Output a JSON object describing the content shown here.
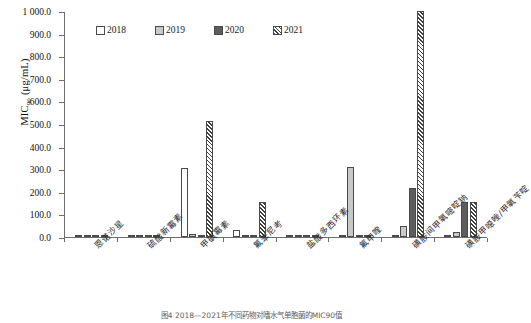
{
  "chart_data": {
    "type": "bar",
    "title": "",
    "xlabel": "",
    "ylabel": "MIC90 (μg/mL)",
    "ylim": [
      0,
      1000
    ],
    "yticks": [
      "0.0",
      "100.0",
      "200.0",
      "300.0",
      "400.0",
      "500.0",
      "600.0",
      "700.0",
      "800.0",
      "900.0",
      "1 000.0"
    ],
    "grid": false,
    "legend_position": "top-center",
    "categories": [
      "恩诺沙星",
      "硫酸新霉素",
      "甲砜霉素",
      "氟苯尼考",
      "盐酸多西环素",
      "氟甲喹",
      "磺胺间甲氧嘧啶钠",
      "磺胺甲噁唑/甲氧苄啶"
    ],
    "series": [
      {
        "name": "2018",
        "style": "white",
        "values": [
          1,
          2,
          305,
          32,
          4,
          8,
          0,
          0
        ]
      },
      {
        "name": "2019",
        "style": "light-gray",
        "values": [
          0,
          1,
          12,
          2,
          4,
          310,
          48,
          24
        ]
      },
      {
        "name": "2020",
        "style": "dark-gray",
        "values": [
          0,
          4,
          8,
          2,
          10,
          4,
          216,
          155
        ]
      },
      {
        "name": "2021",
        "style": "hatched",
        "values": [
          0,
          0,
          512,
          155,
          0,
          0,
          1000,
          155
        ]
      }
    ]
  },
  "axis": {
    "y_title_main": "MIC",
    "y_title_sub": "90",
    "y_title_unit": "(μg/mL)"
  },
  "legend": {
    "items": [
      {
        "label": "2018"
      },
      {
        "label": "2019"
      },
      {
        "label": "2020"
      },
      {
        "label": "2021"
      }
    ]
  },
  "caption": {
    "text": "图4  2018—2021年不同药物对嗜水气单胞菌的MIC90值"
  },
  "colors": {
    "axis": "#6e6e6e",
    "bar_2018": "#ffffff",
    "bar_2019": "#c9c9c9",
    "bar_2020": "#5d5d5d",
    "bar_2021_hatch": "#3d3d3d",
    "text": "#1a1a1a"
  }
}
